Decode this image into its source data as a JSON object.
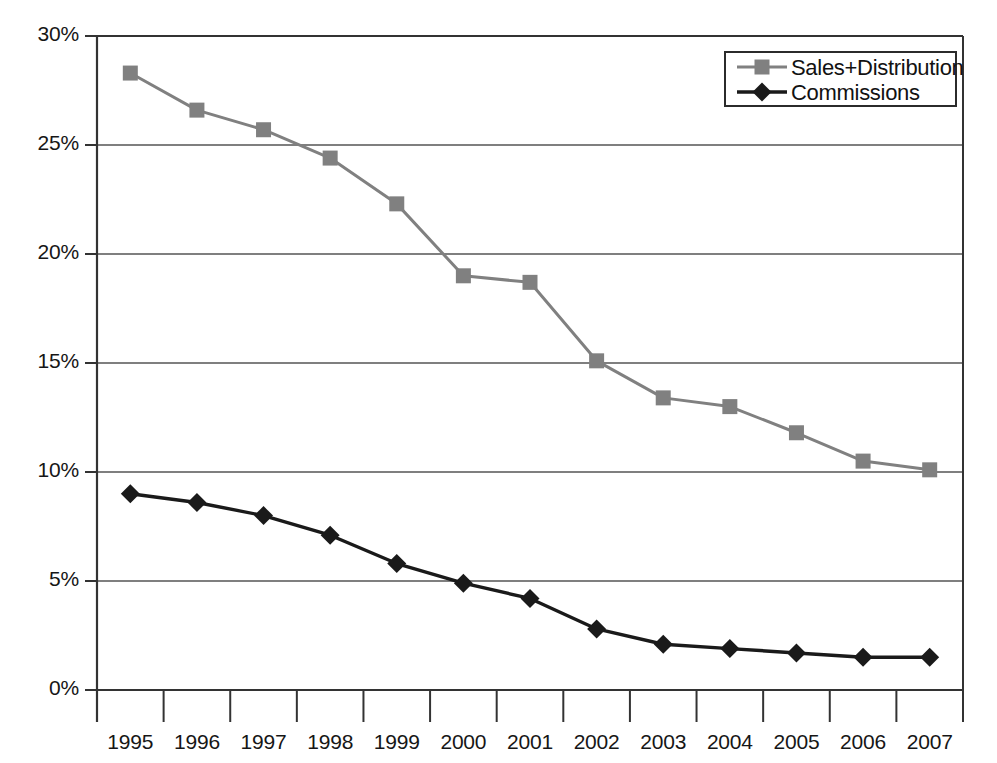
{
  "chart_data": {
    "type": "line",
    "title": "",
    "subtitle": "",
    "xlabel": "",
    "ylabel": "",
    "categories": [
      "1995",
      "1996",
      "1997",
      "1998",
      "1999",
      "2000",
      "2001",
      "2002",
      "2003",
      "2004",
      "2005",
      "2006",
      "2007"
    ],
    "ylim": [
      0,
      30
    ],
    "ytick_labels": [
      "0%",
      "5%",
      "10%",
      "15%",
      "20%",
      "25%",
      "30%"
    ],
    "ytick_values": [
      0,
      5,
      10,
      15,
      20,
      25,
      30
    ],
    "grid": true,
    "grid_axis": "y",
    "legend_position": "top-right",
    "series": [
      {
        "name": "Sales+Distribution",
        "color": "#808080",
        "marker": "square",
        "values": [
          28.3,
          26.6,
          25.7,
          24.4,
          22.3,
          19.0,
          18.7,
          15.1,
          13.4,
          13.0,
          11.8,
          10.5,
          10.1
        ]
      },
      {
        "name": "Commissions",
        "color": "#1a1a1a",
        "marker": "diamond",
        "values": [
          9.0,
          8.6,
          8.0,
          7.1,
          5.8,
          4.9,
          4.2,
          2.8,
          2.1,
          1.9,
          1.7,
          1.5,
          1.5
        ]
      }
    ]
  },
  "legend": {
    "entries": [
      {
        "label": "Sales+Distribution"
      },
      {
        "label": "Commissions"
      }
    ]
  },
  "axis": {
    "y_labels": [
      "30%",
      "25%",
      "20%",
      "15%",
      "10%",
      "5%",
      "0%"
    ],
    "x_labels": [
      "1995",
      "1996",
      "1997",
      "1998",
      "1999",
      "2000",
      "2001",
      "2002",
      "2003",
      "2004",
      "2005",
      "2006",
      "2007"
    ]
  },
  "colors": {
    "series_sales": "#808080",
    "series_commissions": "#1a1a1a",
    "axis": "#333333",
    "grid": "#555555",
    "background": "#ffffff"
  }
}
